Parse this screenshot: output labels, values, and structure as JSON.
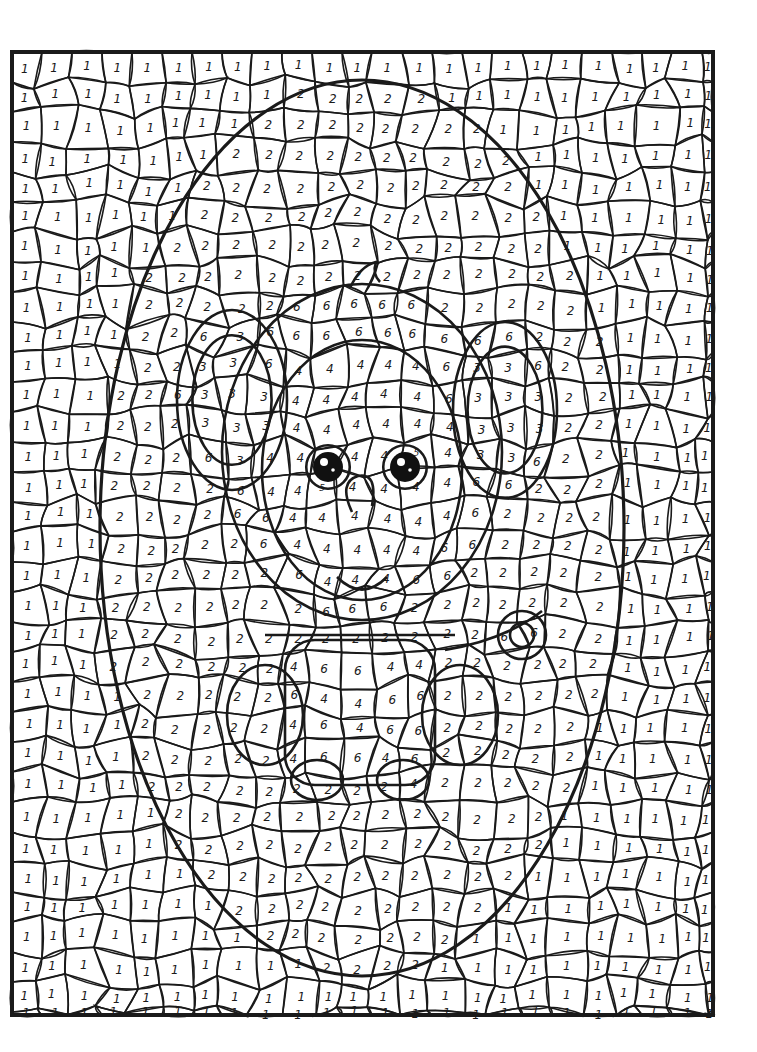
{
  "page": {
    "background": "#ffffff",
    "ink": "#1a1a1a"
  },
  "frame": {
    "x": 12,
    "y": 52,
    "width": 701,
    "height": 963
  },
  "oval": {
    "cx": 362,
    "cy": 528,
    "rx": 262,
    "ry": 448
  },
  "regions": {
    "background": {
      "number": "1"
    },
    "oval_fill": {
      "number": "2"
    },
    "ears_inner": {
      "number": "3"
    },
    "face": {
      "number": "4"
    },
    "eyes": {
      "number": "5"
    },
    "head_body_outline": {
      "number": "6"
    }
  },
  "figure": {
    "head": {
      "cx": 362,
      "cy": 452,
      "rx": 140,
      "ry": 168
    },
    "face": {
      "cx": 362,
      "cy": 470,
      "rx": 100,
      "ry": 130
    },
    "ear_left": {
      "cx": 232,
      "cy": 400,
      "rx": 55,
      "ry": 90
    },
    "ear_right": {
      "cx": 505,
      "cy": 410,
      "rx": 52,
      "ry": 88
    },
    "eye_left": {
      "cx": 328,
      "cy": 467,
      "r": 15
    },
    "eye_right": {
      "cx": 405,
      "cy": 467,
      "r": 15
    },
    "body": {
      "x": 285,
      "y": 640,
      "width": 150,
      "height": 145
    },
    "tail": {
      "cx": 522,
      "cy": 635,
      "r": 24
    }
  }
}
